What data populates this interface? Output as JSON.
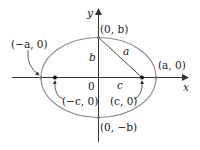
{
  "diagram": {
    "colors": {
      "ellipse": "#8a8a8a",
      "axes": "#333333",
      "point": "#111111",
      "text": "#222222"
    },
    "axes": {
      "x_label": "x",
      "y_label": "y",
      "origin_label": "0"
    },
    "segments": {
      "vertical_label": "b",
      "hypotenuse_label": "a",
      "horizontal_label": "c"
    },
    "points": {
      "top_vertex": "(0, b)",
      "bottom_vertex": "(0, −b)",
      "left_vertex": "(−a, 0)",
      "right_vertex": "(a, 0)",
      "left_focus": "(−c, 0)",
      "right_focus": "(c, 0)"
    }
  }
}
